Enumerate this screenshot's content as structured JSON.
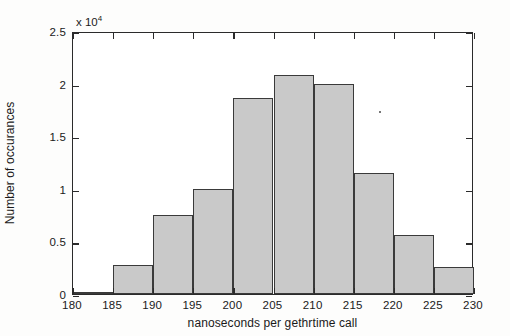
{
  "figure": {
    "background_color": "#ffffff",
    "axis_color": "#2b2b2b",
    "bar_fill_color": "#c9c9c9",
    "bar_edge_color": "#3a3a3a"
  },
  "axis": {
    "y_exponent_prefix": "x 10",
    "y_exponent_power": "4",
    "x_title": "nanoseconds per gethrtime call",
    "y_title": "Number of occurances",
    "x_ticks": [
      "180",
      "185",
      "190",
      "195",
      "200",
      "205",
      "210",
      "215",
      "220",
      "225",
      "230"
    ],
    "y_ticks": [
      "0",
      "0.5",
      "1",
      "1.5",
      "2",
      "2.5"
    ]
  },
  "chart_data": {
    "type": "bar",
    "title": "",
    "xlabel": "nanoseconds per gethrtime call",
    "ylabel": "Number of occurances",
    "y_scale_multiplier": 10000,
    "y_scale_label": "x 10^4",
    "xlim": [
      180,
      230
    ],
    "ylim": [
      0,
      25000
    ],
    "grid": false,
    "legend": false,
    "bin_width": 5,
    "bin_edges": [
      180,
      185,
      190,
      195,
      200,
      205,
      210,
      215,
      220,
      225,
      230
    ],
    "categories": [
      "180-185",
      "185-190",
      "190-195",
      "195-200",
      "200-205",
      "205-210",
      "210-215",
      "215-220",
      "220-225",
      "225-230"
    ],
    "values": [
      0,
      2800,
      7500,
      10000,
      18600,
      20800,
      20000,
      11500,
      5600,
      2600
    ],
    "values_scaled": [
      0.0,
      0.28,
      0.75,
      1.0,
      1.86,
      2.08,
      2.0,
      1.15,
      0.56,
      0.26
    ],
    "x_tick_values": [
      180,
      185,
      190,
      195,
      200,
      205,
      210,
      215,
      220,
      225,
      230
    ],
    "y_tick_values": [
      0,
      5000,
      10000,
      15000,
      20000,
      25000
    ]
  }
}
